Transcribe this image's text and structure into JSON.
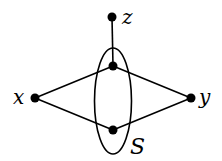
{
  "diagram": {
    "type": "graph",
    "nodes": [
      {
        "id": "z",
        "label": "z",
        "cx": 112,
        "cy": 17
      },
      {
        "id": "s1",
        "label": "",
        "cx": 113,
        "cy": 66
      },
      {
        "id": "x",
        "label": "x",
        "cx": 35,
        "cy": 98
      },
      {
        "id": "y",
        "label": "y",
        "cx": 191,
        "cy": 98
      },
      {
        "id": "s2",
        "label": "",
        "cx": 113,
        "cy": 130
      }
    ],
    "edges": [
      [
        "z",
        "s1"
      ],
      [
        "x",
        "s1"
      ],
      [
        "s1",
        "y"
      ],
      [
        "x",
        "s2"
      ],
      [
        "s2",
        "y"
      ]
    ],
    "set": {
      "label": "S",
      "contains": [
        "s1",
        "s2"
      ]
    },
    "labels": {
      "z": "z",
      "x": "x",
      "y": "y",
      "S": "S"
    }
  }
}
